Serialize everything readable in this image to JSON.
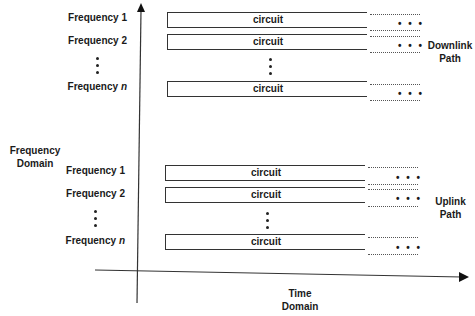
{
  "axes": {
    "y_label_line1": "Frequency",
    "y_label_line2": "Domain",
    "x_label_line1": "Time",
    "x_label_line2": "Domain"
  },
  "downlink": {
    "label_line1": "Downlink",
    "label_line2": "Path",
    "rows": [
      {
        "freq_prefix": "Frequency ",
        "freq_suffix": "1",
        "circuit": "circuit",
        "continuation": "• • •"
      },
      {
        "freq_prefix": "Frequency ",
        "freq_suffix": "2",
        "circuit": "circuit",
        "continuation": "• • •"
      },
      {
        "freq_prefix": "Frequency ",
        "freq_suffix": "n",
        "circuit": "circuit",
        "continuation": "• • •"
      }
    ]
  },
  "uplink": {
    "label_line1": "Uplink",
    "label_line2": "Path",
    "rows": [
      {
        "freq_prefix": "Frequency ",
        "freq_suffix": "1",
        "circuit": "circuit",
        "continuation": "• • •"
      },
      {
        "freq_prefix": "Frequency ",
        "freq_suffix": "2",
        "circuit": "circuit",
        "continuation": "• • •"
      },
      {
        "freq_prefix": "Frequency ",
        "freq_suffix": "n",
        "circuit": "circuit",
        "continuation": "• • •"
      }
    ]
  }
}
